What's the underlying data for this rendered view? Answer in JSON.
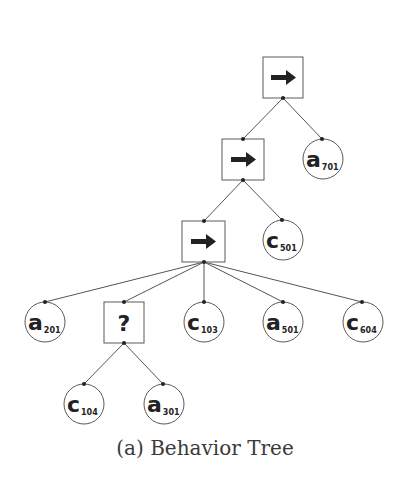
{
  "caption": "(a) Behavior Tree",
  "colors": {
    "stroke": "#5a5a5a",
    "edge": "#555555",
    "glyph": "#222222",
    "background": "#ffffff",
    "caption": "#3a3a3a"
  },
  "nodes": {
    "seq_root": {
      "type": "sequence",
      "icon": "arrow-right-icon"
    },
    "seq_mid": {
      "type": "sequence",
      "icon": "arrow-right-icon"
    },
    "seq_low": {
      "type": "sequence",
      "icon": "arrow-right-icon"
    },
    "fallback": {
      "type": "fallback",
      "glyph": "?"
    },
    "a701": {
      "letter": "a",
      "sub": "701"
    },
    "c501": {
      "letter": "c",
      "sub": "501"
    },
    "a201": {
      "letter": "a",
      "sub": "201"
    },
    "c103": {
      "letter": "c",
      "sub": "103"
    },
    "a501": {
      "letter": "a",
      "sub": "501"
    },
    "c604": {
      "letter": "c",
      "sub": "604"
    },
    "c104": {
      "letter": "c",
      "sub": "104"
    },
    "a301": {
      "letter": "a",
      "sub": "301"
    }
  },
  "edges": [
    [
      "seq_root",
      "seq_mid"
    ],
    [
      "seq_root",
      "a701"
    ],
    [
      "seq_mid",
      "seq_low"
    ],
    [
      "seq_mid",
      "c501"
    ],
    [
      "seq_low",
      "a201"
    ],
    [
      "seq_low",
      "fallback"
    ],
    [
      "seq_low",
      "c103"
    ],
    [
      "seq_low",
      "a501"
    ],
    [
      "seq_low",
      "c604"
    ],
    [
      "fallback",
      "c104"
    ],
    [
      "fallback",
      "a301"
    ]
  ]
}
